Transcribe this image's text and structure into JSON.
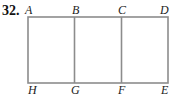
{
  "problem_number": "32.",
  "labels": {
    "top": [
      "A",
      "B",
      "C",
      "D"
    ],
    "bottom": [
      "H",
      "G",
      "F",
      "E"
    ]
  },
  "figure": {
    "line_color": "#8c8c8c"
  }
}
